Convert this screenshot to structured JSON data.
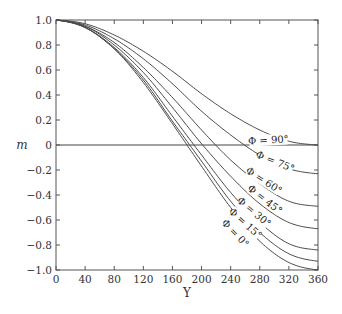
{
  "chart_data": {
    "type": "line",
    "title": "",
    "xlabel": "Υ",
    "ylabel": "m",
    "xlim": [
      0,
      360
    ],
    "ylim": [
      -1.0,
      1.0
    ],
    "xticks": [
      0,
      40,
      80,
      120,
      160,
      200,
      240,
      280,
      320,
      360
    ],
    "yticks": [
      1.0,
      0.8,
      0.6,
      0.4,
      0.2,
      0,
      -0.2,
      -0.4,
      -0.6,
      -0.8,
      -1.0
    ],
    "ytick_labels": [
      "1.0",
      "0.8",
      "0.6",
      "0.4",
      "0.2",
      "0",
      "−0.2",
      "−0.4",
      "−0.6",
      "−0.8",
      "−1.0"
    ],
    "grid": false,
    "legend": "inline labels on curves",
    "reference_line": {
      "y": 0
    },
    "x": [
      0,
      40,
      80,
      120,
      160,
      200,
      240,
      280,
      320,
      360
    ],
    "series": [
      {
        "name": "Φ = 90°",
        "end_value": 0.0,
        "values": [
          1.0,
          0.97,
          0.88,
          0.75,
          0.59,
          0.41,
          0.25,
          0.12,
          0.03,
          0.0
        ]
      },
      {
        "name": "Φ = 75°",
        "end_value": -0.23,
        "values": [
          1.0,
          0.96,
          0.85,
          0.69,
          0.49,
          0.27,
          0.08,
          -0.08,
          -0.19,
          -0.23
        ]
      },
      {
        "name": "Φ = 60°",
        "end_value": -0.49,
        "values": [
          1.0,
          0.95,
          0.82,
          0.62,
          0.38,
          0.12,
          -0.12,
          -0.31,
          -0.45,
          -0.49
        ]
      },
      {
        "name": "Φ = 45°",
        "end_value": -0.67,
        "values": [
          1.0,
          0.95,
          0.8,
          0.58,
          0.3,
          0.01,
          -0.25,
          -0.47,
          -0.62,
          -0.67
        ]
      },
      {
        "name": "Φ = 30°",
        "end_value": -0.84,
        "values": [
          1.0,
          0.94,
          0.78,
          0.54,
          0.23,
          -0.08,
          -0.38,
          -0.62,
          -0.79,
          -0.84
        ]
      },
      {
        "name": "Φ = 15°",
        "end_value": -0.93,
        "values": [
          1.0,
          0.94,
          0.77,
          0.52,
          0.19,
          -0.13,
          -0.45,
          -0.7,
          -0.87,
          -0.93
        ]
      },
      {
        "name": "Φ = 0°",
        "end_value": -1.0,
        "values": [
          1.0,
          0.94,
          0.77,
          0.5,
          0.17,
          -0.17,
          -0.5,
          -0.77,
          -0.94,
          -1.0
        ]
      }
    ],
    "annotations": [
      {
        "text": "Φ = 90°",
        "x": 292,
        "y": 0.02,
        "angle": -3
      },
      {
        "text": "Φ = 75°",
        "x": 300,
        "y": -0.15,
        "angle": 22
      },
      {
        "text": "Φ = 60°",
        "x": 284,
        "y": -0.3,
        "angle": 33
      },
      {
        "text": "Φ = 45°",
        "x": 285,
        "y": -0.45,
        "angle": 38
      },
      {
        "text": "Φ = 30°",
        "x": 270,
        "y": -0.55,
        "angle": 40
      },
      {
        "text": "Φ = 15°",
        "x": 258,
        "y": -0.64,
        "angle": 42
      },
      {
        "text": "Φ = 0°",
        "x": 244,
        "y": -0.72,
        "angle": 46
      }
    ]
  },
  "plot_area": {
    "left": 56,
    "right": 318,
    "top": 20,
    "bottom": 270
  },
  "colors": {
    "curve": "#4a4a4a",
    "axis": "#555555",
    "text": "#333333"
  }
}
